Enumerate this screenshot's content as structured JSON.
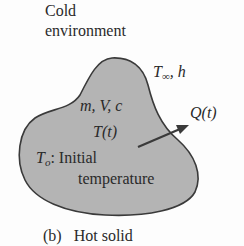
{
  "diagram": {
    "environment_label": [
      "Cold",
      "environment"
    ],
    "ambient_label": {
      "T": "T",
      "sub": "∞",
      "rest": ", h"
    },
    "body_labels": {
      "properties": "m, V, c",
      "temperature": "T(t)",
      "initial_symbol": "T",
      "initial_sub": "o",
      "initial_text": ": Initial",
      "initial_text2": "temperature"
    },
    "heat_flow_label": "Q(t)",
    "caption": {
      "tag": "(b)",
      "text": "Hot solid"
    },
    "colors": {
      "body_fill": "#b4b4b4",
      "body_stroke": "#3a3a3a",
      "arrow": "#3a3a3a",
      "text": "#2a2a2a"
    }
  }
}
